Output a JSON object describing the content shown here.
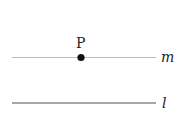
{
  "diagram": {
    "point": {
      "label": "P"
    },
    "lines": [
      {
        "id": "m",
        "label": "m",
        "description": "line through point P"
      },
      {
        "id": "l",
        "label": "l",
        "description": "line parallel to m"
      }
    ]
  }
}
